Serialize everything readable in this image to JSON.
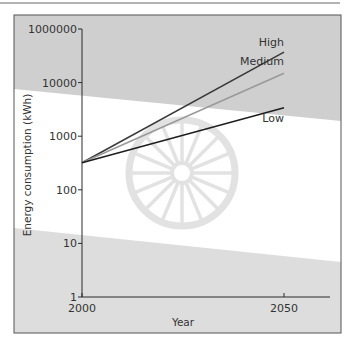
{
  "chart_data": {
    "type": "line",
    "title": "",
    "xlabel": "Year",
    "ylabel": "Energy consumption (kWh)",
    "y_scale": "log",
    "x_ticks": [
      {
        "value": 2000,
        "label": "2000"
      },
      {
        "value": 2050,
        "label": "2050"
      }
    ],
    "y_ticks": [
      {
        "value": 1,
        "label": "1"
      },
      {
        "value": 10,
        "label": "10"
      },
      {
        "value": 100,
        "label": "100"
      },
      {
        "value": 1000,
        "label": "1000"
      },
      {
        "value": 10000,
        "label": "10000"
      },
      {
        "value": 100000,
        "label": "1000000"
      }
    ],
    "xlim": [
      2000,
      2061
    ],
    "ylim": [
      1,
      200000
    ],
    "grid": false,
    "legend": "inline-right",
    "series": [
      {
        "name": "High",
        "color": "#3a3a3a",
        "x": [
          2000,
          2050
        ],
        "values": [
          320,
          37000
        ]
      },
      {
        "name": "Medium",
        "color": "#9a9a9a",
        "x": [
          2000,
          2050
        ],
        "values": [
          320,
          15000
        ]
      },
      {
        "name": "Low",
        "color": "#1e1e1e",
        "x": [
          2000,
          2050
        ],
        "values": [
          320,
          3400
        ]
      }
    ],
    "colors": {
      "band": "#cfcfcf",
      "band_light": "#dddddd",
      "wheel": "#e2e2e2",
      "axis": "#2a2a2a",
      "frame": "#555555"
    }
  }
}
